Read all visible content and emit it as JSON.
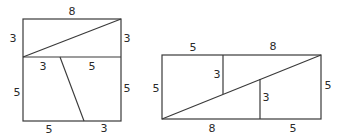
{
  "figures": [
    {
      "name": "square-dissection",
      "description": "8x8 square cut into pieces",
      "labels": {
        "top": "8",
        "upper_left": "3",
        "upper_right": "3",
        "middle_left_segment": "3",
        "middle_right_segment": "5",
        "lower_left": "5",
        "lower_right": "5",
        "bottom_left": "5",
        "bottom_right": "3"
      }
    },
    {
      "name": "rectangle-rearrangement",
      "description": "13x5 rectangle formed from same pieces",
      "labels": {
        "top_left": "5",
        "top_right": "8",
        "left": "5",
        "right": "5",
        "inner_vertical_left": "3",
        "inner_vertical_right": "3",
        "bottom_left": "8",
        "bottom_right": "5"
      }
    }
  ],
  "style": {
    "line_color": "#3a3a3a",
    "text_color": "#2a2a2a",
    "background": "#ffffff"
  }
}
